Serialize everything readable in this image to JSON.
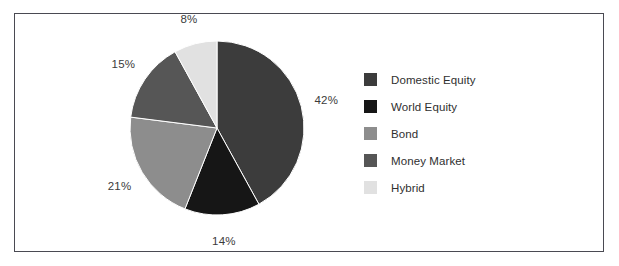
{
  "chart_data": {
    "type": "pie",
    "title": "",
    "categories": [
      "Domestic Equity",
      "World Equity",
      "Bond",
      "Money Market",
      "Hybrid"
    ],
    "values": [
      42,
      14,
      21,
      15,
      8
    ],
    "value_labels": [
      "42%",
      "14%",
      "21%",
      "15%",
      "8%"
    ],
    "unit": "%",
    "total": 100,
    "start_angle_deg": 0,
    "direction": "clockwise",
    "legend_position": "right",
    "grid": false,
    "colors": [
      "#3c3c3c",
      "#161616",
      "#8d8d8d",
      "#565656",
      "#e1e1e1"
    ],
    "slices": [
      {
        "label": "Domestic Equity",
        "value": 42,
        "value_label": "42%",
        "color": "#3c3c3c"
      },
      {
        "label": "World Equity",
        "value": 14,
        "value_label": "14%",
        "color": "#161616"
      },
      {
        "label": "Bond",
        "value": 21,
        "value_label": "21%",
        "color": "#8d8d8d"
      },
      {
        "label": "Money Market",
        "value": 15,
        "value_label": "15%",
        "color": "#565656"
      },
      {
        "label": "Hybrid",
        "value": 8,
        "value_label": "8%",
        "color": "#e1e1e1"
      }
    ]
  },
  "legend": {
    "items": [
      {
        "label": "Domestic Equity",
        "color": "#3c3c3c"
      },
      {
        "label": "World Equity",
        "color": "#161616"
      },
      {
        "label": "Bond",
        "color": "#8d8d8d"
      },
      {
        "label": "Money Market",
        "color": "#565656"
      },
      {
        "label": "Hybrid",
        "color": "#e1e1e1"
      }
    ]
  },
  "frame": {
    "border_color": "#4a4a52",
    "background": "#ffffff"
  }
}
